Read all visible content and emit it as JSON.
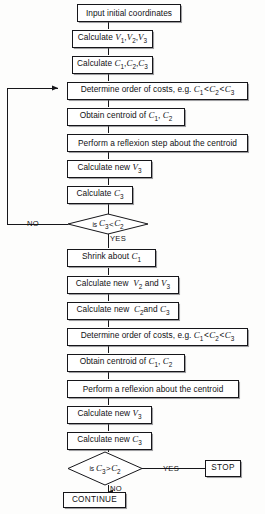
{
  "diagram": {
    "type": "flowchart",
    "line_color": "#16161a",
    "background": "#fdfdfc"
  },
  "nodes": [
    {
      "id": "input",
      "shape": "process",
      "text": "Input initial coordinates"
    },
    {
      "id": "calc_v",
      "shape": "process",
      "text": "Calculate V1, V2, V3"
    },
    {
      "id": "calc_c",
      "shape": "process",
      "text": "Calculate C1,C2,C3"
    },
    {
      "id": "order1",
      "shape": "process",
      "text": "Determine order of costs, e.g. C1< C2< C3"
    },
    {
      "id": "centroid1",
      "shape": "process",
      "text": "Obtain centroid of C1, C2"
    },
    {
      "id": "reflex1",
      "shape": "process",
      "text": "Perform a reflexion step about the centroid"
    },
    {
      "id": "calc_v3_a",
      "shape": "process",
      "text": "Calculate new V3"
    },
    {
      "id": "calc_c3_a",
      "shape": "process",
      "text": "Calculate C3"
    },
    {
      "id": "decision1",
      "shape": "decision",
      "text": "is C3< C2"
    },
    {
      "id": "shrink",
      "shape": "process",
      "text": "Shrink about C1"
    },
    {
      "id": "calc_v23",
      "shape": "process",
      "text": "Calculate new V2 and V3"
    },
    {
      "id": "calc_c23",
      "shape": "process",
      "text": "Calculate new C2and C3"
    },
    {
      "id": "order2",
      "shape": "process",
      "text": "Determine order of costs, e.g. C1< C2< C3"
    },
    {
      "id": "centroid2",
      "shape": "process",
      "text": "Obtain centroid of C1, C2"
    },
    {
      "id": "reflex2",
      "shape": "process",
      "text": "Perform a reflexion about the centroid"
    },
    {
      "id": "calc_v3_b",
      "shape": "process",
      "text": "Calculate new V3"
    },
    {
      "id": "calc_c3_b",
      "shape": "process",
      "text": "Calculate new C3"
    },
    {
      "id": "decision2",
      "shape": "decision",
      "text": "is C3> C2"
    },
    {
      "id": "stop",
      "shape": "terminator",
      "text": "STOP"
    },
    {
      "id": "continue",
      "shape": "terminator",
      "text": "CONTINUE"
    }
  ],
  "edge_labels": {
    "decision1_no": "NO",
    "decision1_yes": "YES",
    "decision2_yes": "YES",
    "decision2_no": "NO"
  }
}
